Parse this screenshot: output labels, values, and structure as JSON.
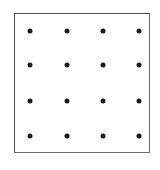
{
  "figure": {
    "background_color": "#ffffff",
    "frame": {
      "name": "square-border",
      "border_color": "#4d4d4d",
      "border_width_px": 1,
      "x_px": 14,
      "y_px": 13,
      "width_px": 136,
      "height_px": 140
    }
  },
  "chart_data": {
    "type": "scatter",
    "title": "",
    "subtitle": "",
    "xlabel": "",
    "ylabel": "",
    "grid": false,
    "legend": null,
    "rows": 4,
    "columns": 4,
    "point_count": 16,
    "point_color": "#1a1a1a",
    "point_diameter_px": 5,
    "point_marker": "filled-circle",
    "xlim": [
      14,
      150
    ],
    "ylim": [
      13,
      153
    ],
    "column_x_px": [
      29,
      66,
      102,
      138
    ],
    "row_y_px": [
      30,
      64,
      100,
      135
    ],
    "x": [
      29,
      66,
      102,
      138,
      29,
      66,
      102,
      138,
      29,
      66,
      102,
      138,
      29,
      66,
      102,
      138
    ],
    "y": [
      30,
      30,
      30,
      30,
      64,
      64,
      64,
      64,
      100,
      100,
      100,
      100,
      135,
      135,
      135,
      135
    ],
    "points": [
      {
        "row": 1,
        "col": 1,
        "x": 29,
        "y": 30
      },
      {
        "row": 1,
        "col": 2,
        "x": 66,
        "y": 30
      },
      {
        "row": 1,
        "col": 3,
        "x": 102,
        "y": 30
      },
      {
        "row": 1,
        "col": 4,
        "x": 138,
        "y": 30
      },
      {
        "row": 2,
        "col": 1,
        "x": 29,
        "y": 64
      },
      {
        "row": 2,
        "col": 2,
        "x": 66,
        "y": 64
      },
      {
        "row": 2,
        "col": 3,
        "x": 102,
        "y": 64
      },
      {
        "row": 2,
        "col": 4,
        "x": 138,
        "y": 64
      },
      {
        "row": 3,
        "col": 1,
        "x": 29,
        "y": 100
      },
      {
        "row": 3,
        "col": 2,
        "x": 66,
        "y": 100
      },
      {
        "row": 3,
        "col": 3,
        "x": 102,
        "y": 100
      },
      {
        "row": 3,
        "col": 4,
        "x": 138,
        "y": 100
      },
      {
        "row": 4,
        "col": 1,
        "x": 29,
        "y": 135
      },
      {
        "row": 4,
        "col": 2,
        "x": 66,
        "y": 135
      },
      {
        "row": 4,
        "col": 3,
        "x": 102,
        "y": 135
      },
      {
        "row": 4,
        "col": 4,
        "x": 138,
        "y": 135
      }
    ]
  }
}
